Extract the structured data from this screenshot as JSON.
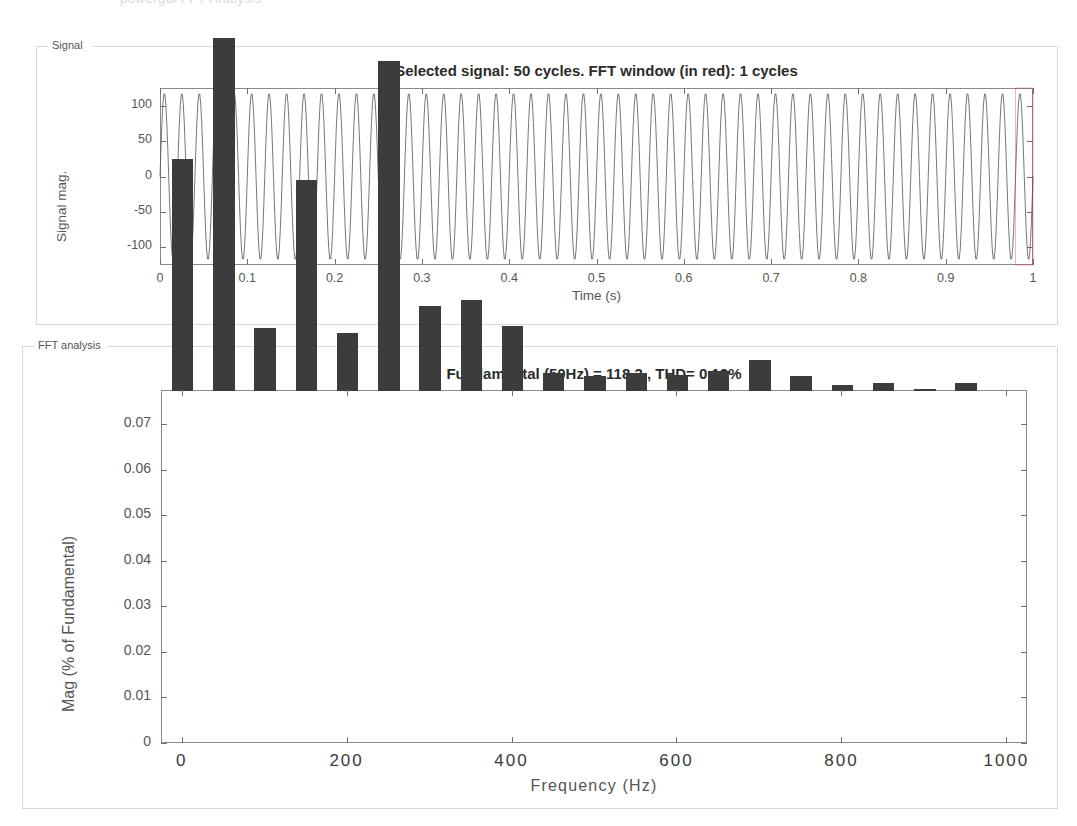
{
  "window": {
    "scan_ghost_text": "powergui FFT Analysis"
  },
  "signal_panel": {
    "group_label": "Signal",
    "title": "Selected signal: 50 cycles. FFT window (in red): 1 cycles",
    "xlabel": "Time (s)",
    "ylabel": "Signal mag.",
    "x_ticks": [
      "0",
      "0.1",
      "0.2",
      "0.3",
      "0.4",
      "0.5",
      "0.6",
      "0.7",
      "0.8",
      "0.9",
      "1"
    ],
    "y_ticks": [
      "100",
      "50",
      "0",
      "-50",
      "-100"
    ]
  },
  "fft_panel": {
    "group_label": "FFT analysis",
    "title": "Fundamental (50Hz) = 118.3 , THD= 0.12%",
    "xlabel": "Frequency (Hz)",
    "ylabel": "Mag (% of Fundamental)",
    "x_ticks": [
      "0",
      "200",
      "400",
      "600",
      "800",
      "1000"
    ],
    "y_ticks": [
      "0",
      "0.01",
      "0.02",
      "0.03",
      "0.04",
      "0.05",
      "0.06",
      "0.07"
    ]
  },
  "colors": {
    "bar_fill": "#3c3c3c",
    "axis_line": "#8a8a8a",
    "text": "#4a4a4a",
    "fft_window": "#ff0000"
  },
  "chart_data": [
    {
      "type": "line",
      "id": "selected-signal",
      "title": "Selected signal: 50 cycles. FFT window (in red): 1 cycles",
      "xlabel": "Time (s)",
      "ylabel": "Signal mag.",
      "xlim": [
        0,
        1
      ],
      "ylim": [
        -125,
        125
      ],
      "xticks": [
        0,
        0.1,
        0.2,
        0.3,
        0.4,
        0.5,
        0.6,
        0.7,
        0.8,
        0.9,
        1
      ],
      "yticks": [
        -100,
        -50,
        0,
        50,
        100
      ],
      "grid": false,
      "legend": "none",
      "series": [
        {
          "name": "signal",
          "waveform": "sine",
          "frequency_hz": 50,
          "cycles": 50,
          "amplitude": 118.3,
          "samples_per_cycle": 64
        }
      ],
      "annotations": [
        {
          "text": "FFT window (in red): 1 cycles",
          "color": "#ff0000",
          "x_range": [
            0.98,
            1.0
          ]
        }
      ]
    },
    {
      "type": "bar",
      "id": "fft-spectrum",
      "title": "Fundamental (50Hz) = 118.3 , THD= 0.12%",
      "xlabel": "Frequency (Hz)",
      "ylabel": "Mag (% of Fundamental)",
      "xlim": [
        -25,
        1025
      ],
      "ylim": [
        0,
        0.0775
      ],
      "xticks": [
        0,
        200,
        400,
        600,
        800,
        1000
      ],
      "yticks": [
        0,
        0.01,
        0.02,
        0.03,
        0.04,
        0.05,
        0.06,
        0.07
      ],
      "grid": false,
      "legend": "none",
      "bar_width_hz": 26,
      "categories": [
        0,
        50,
        100,
        150,
        200,
        250,
        300,
        350,
        400,
        450,
        500,
        550,
        600,
        650,
        700,
        750,
        800,
        850,
        900,
        950,
        1000
      ],
      "values": [
        0.051,
        0.079,
        0.0138,
        0.0464,
        0.0128,
        0.0725,
        0.0187,
        0.02,
        0.0142,
        0.0039,
        0.0034,
        0.004,
        0.0036,
        0.0045,
        0.0067,
        0.0032,
        0.0013,
        0.0017,
        0.0005,
        0.0018,
        0.0
      ],
      "clipped_bars": [
        50
      ],
      "notes": "Bar at 50 Hz (fundamental, 100%) is clipped by the y-axis upper limit."
    }
  ]
}
